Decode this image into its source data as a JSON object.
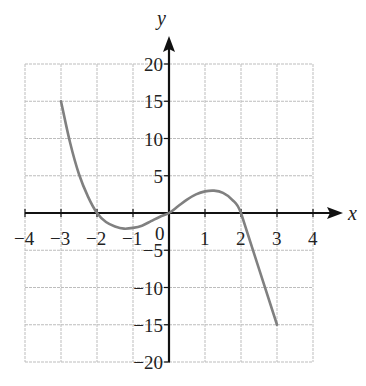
{
  "chart_data": {
    "type": "line",
    "title": "",
    "xlabel": "x",
    "ylabel": "y",
    "xlim": [
      -4,
      4
    ],
    "ylim": [
      -20,
      20
    ],
    "grid": true,
    "x_ticks": [
      -4,
      -3,
      -2,
      -1,
      0,
      1,
      2,
      3,
      4
    ],
    "x_tick_labels": [
      "-4",
      "-3",
      "-2",
      "-1",
      "0",
      "1",
      "2",
      "3",
      "4"
    ],
    "y_ticks": [
      -20,
      -15,
      -10,
      -5,
      5,
      10,
      15,
      20
    ],
    "y_tick_labels": [
      "-20",
      "-15",
      "-10",
      "-5",
      "5",
      "10",
      "15",
      "20"
    ],
    "origin_label": "0",
    "series": [
      {
        "name": "f(x)",
        "color": "#808080",
        "points": [
          [
            -3,
            15
          ],
          [
            -2.75,
            9.5
          ],
          [
            -2.5,
            5.2
          ],
          [
            -2.25,
            2.2
          ],
          [
            -2,
            0
          ],
          [
            -1.75,
            -1.2
          ],
          [
            -1.5,
            -1.8
          ],
          [
            -1.25,
            -2.1
          ],
          [
            -1,
            -2
          ],
          [
            -0.75,
            -1.7
          ],
          [
            -0.5,
            -1.1
          ],
          [
            -0.25,
            -0.5
          ],
          [
            0,
            0
          ],
          [
            0.25,
            0.9
          ],
          [
            0.5,
            1.8
          ],
          [
            0.75,
            2.5
          ],
          [
            1,
            2.9
          ],
          [
            1.25,
            3
          ],
          [
            1.5,
            2.7
          ],
          [
            1.75,
            1.8
          ],
          [
            2,
            0
          ],
          [
            2.5,
            -7.5
          ],
          [
            3,
            -15
          ]
        ]
      }
    ]
  }
}
